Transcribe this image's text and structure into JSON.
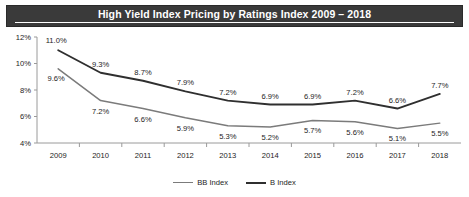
{
  "header": {
    "title": "High Yield Index Pricing by Ratings Index 2009 – 2018"
  },
  "legend": {
    "items": [
      {
        "label": "BB Index",
        "color": "#7b7b7b"
      },
      {
        "label": "B Index",
        "color": "#2f2f2f"
      }
    ]
  },
  "axis": {
    "y_ticks": [
      "4%",
      "6%",
      "8%",
      "10%",
      "12%"
    ],
    "x_ticks": [
      "2009",
      "2010",
      "2011",
      "2012",
      "2013",
      "2014",
      "2015",
      "2016",
      "2017",
      "2018"
    ]
  },
  "chart_data": {
    "type": "line",
    "title": "High Yield Index Pricing by Ratings Index 2009 – 2018",
    "xlabel": "",
    "ylabel": "",
    "ylim": [
      4,
      12
    ],
    "ytick_values": [
      4,
      6,
      8,
      10,
      12
    ],
    "ytick_labels": [
      "4%",
      "6%",
      "8%",
      "10%",
      "12%"
    ],
    "grid": false,
    "legend_position": "bottom-center",
    "categories": [
      "2009",
      "2010",
      "2011",
      "2012",
      "2013",
      "2014",
      "2015",
      "2016",
      "2017",
      "2018"
    ],
    "series": [
      {
        "name": "BB Index",
        "color": "#7b7b7b",
        "values": [
          9.6,
          7.2,
          6.6,
          5.9,
          5.3,
          5.2,
          5.7,
          5.6,
          5.1,
          5.5
        ],
        "labels": [
          "9.6%",
          "7.2%",
          "6.6%",
          "5.9%",
          "5.3%",
          "5.2%",
          "5.7%",
          "5.6%",
          "5.1%",
          "5.5%"
        ]
      },
      {
        "name": "B Index",
        "color": "#2f2f2f",
        "values": [
          11.0,
          9.3,
          8.7,
          7.9,
          7.2,
          6.9,
          6.9,
          7.2,
          6.6,
          7.7
        ],
        "labels": [
          "11.0%",
          "9.3%",
          "8.7%",
          "7.9%",
          "7.2%",
          "6.9%",
          "6.9%",
          "7.2%",
          "6.6%",
          "7.7%"
        ]
      }
    ]
  }
}
